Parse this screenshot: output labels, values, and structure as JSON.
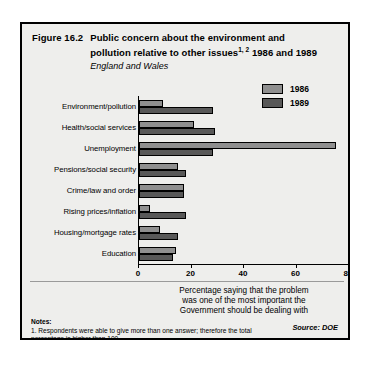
{
  "figure": {
    "number": "Figure 16.2",
    "title_line_1": "Public concern about the environment and",
    "title_line_2_a": "pollution relative to other issues",
    "title_line_2_sup": "1, 2",
    "title_line_2_b": "1986 and 1989",
    "subtitle": "England and Wales",
    "source": "Source: DOE"
  },
  "legend": {
    "position": "top-right",
    "entries": [
      {
        "label": "1986",
        "color": "#8f8f8f"
      },
      {
        "label": "1989",
        "color": "#585858"
      }
    ]
  },
  "axis_caption": {
    "line_1": "Percentage saying that the problem",
    "line_2": "was one of the most important the",
    "line_3": "Government should be dealing with"
  },
  "notes": {
    "heading": "Notes:",
    "items": [
      "1.  Respondents were able to give more than one answer; therefore the total",
      "percentage is higher than 100.",
      "2.  All other issues were mentioned by 10% or less of respondents."
    ]
  },
  "chart_data": {
    "type": "bar",
    "orientation": "horizontal",
    "subtitle": "England and Wales",
    "xlabel": "Percentage saying that the problem was one of the most important the Government should be dealing with",
    "ylabel": "",
    "xlim": [
      0,
      80
    ],
    "xticks": [
      0,
      20,
      40,
      60,
      80
    ],
    "grid": false,
    "legend_position": "top-right",
    "categories": [
      "Environment/pollution",
      "Health/social services",
      "Unemployment",
      "Pensions/social security",
      "Crime/law and order",
      "Rising prices/inflation",
      "Housing/mortgage rates",
      "Education"
    ],
    "series": [
      {
        "name": "1986",
        "color": "#8f8f8f",
        "values": [
          9,
          21,
          75,
          15,
          17,
          4,
          8,
          14
        ]
      },
      {
        "name": "1989",
        "color": "#585858",
        "values": [
          28,
          29,
          28,
          18,
          17,
          18,
          15,
          13
        ]
      }
    ]
  }
}
